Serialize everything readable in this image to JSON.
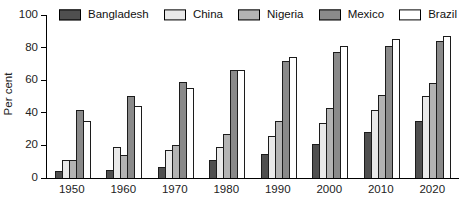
{
  "chart_data": {
    "type": "bar",
    "title": "",
    "xlabel": "",
    "ylabel": "Per cent",
    "ylim": [
      0,
      100
    ],
    "yticks": [
      0,
      20,
      40,
      60,
      80,
      100
    ],
    "grid": false,
    "legend_position": "top",
    "bar_border_color": "#1c1c1c",
    "categories": [
      "1950",
      "1960",
      "1970",
      "1980",
      "1990",
      "2000",
      "2010",
      "2020"
    ],
    "series": [
      {
        "name": "Bangladesh",
        "color": "#4f4f4f",
        "values": [
          4,
          5,
          7,
          11,
          15,
          21,
          28,
          35
        ]
      },
      {
        "name": "China",
        "color": "#e9e9e9",
        "values": [
          11,
          19,
          17,
          19,
          26,
          34,
          42,
          50
        ]
      },
      {
        "name": "Nigeria",
        "color": "#b3b3b3",
        "values": [
          11,
          14,
          20,
          27,
          35,
          43,
          51,
          58
        ]
      },
      {
        "name": "Mexico",
        "color": "#8a8a8a",
        "values": [
          42,
          50,
          59,
          66,
          72,
          77,
          81,
          84
        ]
      },
      {
        "name": "Brazil",
        "color": "#ffffff",
        "values": [
          35,
          44,
          55,
          66,
          74,
          81,
          85,
          87
        ]
      }
    ]
  }
}
